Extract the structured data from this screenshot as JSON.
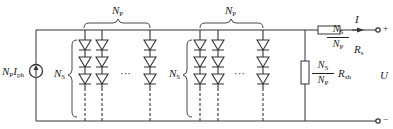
{
  "diagram": {
    "source_label": {
      "main": "N",
      "sub1": "P",
      "main2": "I",
      "sub2": "ph"
    },
    "groups": [
      {
        "np_label": {
          "main": "N",
          "sub": "P"
        },
        "ns_label": {
          "main": "N",
          "sub": "S"
        },
        "ellipsis": "···"
      },
      {
        "np_label": {
          "main": "N",
          "sub": "P"
        },
        "ns_label": {
          "main": "N",
          "sub": "S"
        },
        "ellipsis": "···"
      }
    ],
    "shunt_resistor": {
      "num": {
        "main": "N",
        "sub": "S"
      },
      "den": {
        "main": "N",
        "sub": "P"
      },
      "r": {
        "main": "R",
        "sub": "sh"
      }
    },
    "series_resistor": {
      "num": {
        "main": "N",
        "sub": "S"
      },
      "den": {
        "main": "N",
        "sub": "P"
      },
      "r": {
        "main": "R",
        "sub": "s"
      }
    },
    "current_label": "I",
    "voltage_label": "U",
    "plus_terminal": "+",
    "minus_terminal": "−",
    "colors": {
      "line": "#333333",
      "background": "#ffffff"
    }
  }
}
